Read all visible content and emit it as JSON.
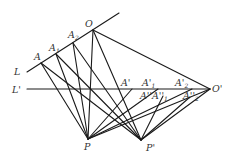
{
  "figure": {
    "type": "geometric-projection-diagram",
    "line_color": "#1a1a1a",
    "label_color": "#333333"
  },
  "labels": {
    "L": "L",
    "L_prime": "L'",
    "A": "A",
    "A1": "A",
    "A1_sub": "1",
    "A2": "A",
    "A2_sub": "2",
    "O": "O",
    "O_prime": "O'",
    "A_prime": "A'",
    "A1_prime": "A'",
    "A1_prime_sub": "1",
    "A2_prime": "A'",
    "A2_prime_sub": "2",
    "A_dprime": "A''",
    "A1_dprime": "A''",
    "A1_dprime_sub": "1",
    "A2_dprime": "A''",
    "A2_dprime_sub": "2",
    "P": "P",
    "P_prime": "P'"
  },
  "points": {
    "A": [
      41,
      63
    ],
    "A1": [
      56,
      54
    ],
    "A2": [
      73,
      43
    ],
    "O": [
      93,
      30
    ],
    "L_start": [
      27,
      72
    ],
    "L_end": [
      119,
      13
    ],
    "Lp_start": [
      27,
      89
    ],
    "O_prime": [
      210,
      89
    ],
    "A_prime": [
      124,
      89
    ],
    "A1_prime": [
      147,
      89
    ],
    "A2_prime": [
      183,
      89
    ],
    "P": [
      88,
      139
    ],
    "P_prime": [
      141,
      140
    ]
  }
}
